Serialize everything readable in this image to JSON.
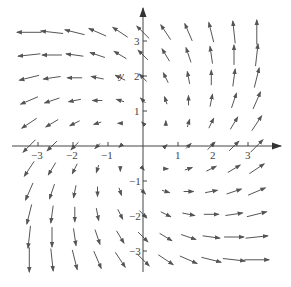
{
  "chart_data": {
    "type": "vector_field",
    "title": "",
    "field": {
      "u": "x - y",
      "v": "x + y"
    },
    "xlabel": "x",
    "ylabel": "y",
    "xlim": [
      -3.6,
      3.9
    ],
    "ylim": [
      -3.6,
      4.0
    ],
    "grid": false,
    "x_ticks": [
      -3,
      -2,
      -1,
      1,
      2,
      3
    ],
    "y_ticks": [
      -3,
      -2,
      -1,
      1,
      2,
      3
    ],
    "x_tick_labels": [
      "−3",
      "−2",
      "−1",
      "1",
      "2",
      "3"
    ],
    "y_tick_labels": [
      "−3",
      "−2",
      "−1",
      "1",
      "2",
      "3"
    ],
    "sample_grid": [
      -3.25,
      -2.6,
      -1.95,
      -1.3,
      -0.65,
      0,
      0.65,
      1.3,
      1.95,
      2.6,
      3.25
    ],
    "arrow_color": "#555555",
    "axis_color": "#555555",
    "sample_vectors": [
      {
        "x": -3.25,
        "y": 3.25,
        "u": -6.5,
        "v": 0
      },
      {
        "x": 3.25,
        "y": 3.25,
        "u": 0,
        "v": 6.5
      },
      {
        "x": -3.25,
        "y": -3.25,
        "u": 0,
        "v": -6.5
      },
      {
        "x": 3.25,
        "y": -3.25,
        "u": 6.5,
        "v": 0
      },
      {
        "x": 1.3,
        "y": 3.25,
        "u": -1.95,
        "v": 4.55
      },
      {
        "x": 3.25,
        "y": 1.3,
        "u": 1.95,
        "v": 4.55
      },
      {
        "x": -1.3,
        "y": -3.25,
        "u": 1.95,
        "v": -4.55
      },
      {
        "x": -3.25,
        "y": -1.3,
        "u": -1.95,
        "v": -4.55
      }
    ]
  },
  "axes": {
    "y_label": "y"
  }
}
